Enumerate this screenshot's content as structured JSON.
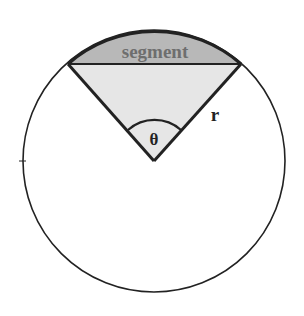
{
  "diagram": {
    "labels": {
      "segment": "segment",
      "radius": "r",
      "angle": "θ"
    },
    "colors": {
      "segment_fill": "#b8b8b8",
      "sector_fill": "#e6e6e6",
      "stroke": "#222222",
      "segment_text": "#6e6e6e",
      "background": "#ffffff"
    },
    "geometry": {
      "circle_center": [
        154,
        161
      ],
      "circle_radius": 131,
      "chord_endpoints": [
        [
          68,
          64
        ],
        [
          241,
          64
        ]
      ]
    }
  }
}
